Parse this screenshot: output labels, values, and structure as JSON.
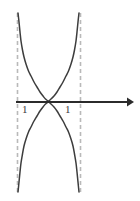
{
  "figure": {
    "title": "",
    "background_color": "#ffffff",
    "width": 140,
    "height": 201
  },
  "axis": {
    "x_axis_name": "x-axis",
    "arrow_name": "x-axis-arrow",
    "color": "#2b2b2b",
    "y_position": 102,
    "x_start": 16,
    "x_end": 134,
    "has_arrowhead": true
  },
  "asymptotes": {
    "style": "dashed",
    "color": "#b9b9b9",
    "lines": [
      {
        "name": "asymptote-left",
        "x_value": -1,
        "x_px": 17,
        "y_top": 13,
        "y_bottom": 192
      },
      {
        "name": "asymptote-right",
        "x_value": 1,
        "x_px": 80,
        "y_top": 13,
        "y_bottom": 192
      }
    ]
  },
  "labels": {
    "left": {
      "text": "1",
      "value": -1,
      "name": "tick-label-left"
    },
    "right": {
      "text": "1",
      "value": 1,
      "name": "tick-label-right"
    }
  },
  "chart_data": {
    "type": "line",
    "title": "",
    "xlabel": "",
    "ylabel": "",
    "xlim": [
      -1.6,
      3.0
    ],
    "ylim": [
      -2.3,
      2.3
    ],
    "grid": false,
    "legend": null,
    "annotations": [
      "vertical dashed asymptote at x = -1",
      "vertical dashed asymptote at x = 1",
      "both curve branches pass through the origin (0, 0)"
    ],
    "curve_color": "#3d3d3d",
    "series": [
      {
        "name": "upper-branch",
        "description": "U-shaped branch opening upward between the asymptotes, minimum at origin, rising to +infinity at x = -1 and x = 1",
        "points_px": [
          [
            18,
            13
          ],
          [
            19,
            22
          ],
          [
            20,
            32
          ],
          [
            21,
            41
          ],
          [
            22.5,
            50
          ],
          [
            24,
            57
          ],
          [
            26,
            64
          ],
          [
            28.5,
            71
          ],
          [
            31,
            76
          ],
          [
            34,
            82
          ],
          [
            37,
            87
          ],
          [
            40,
            92
          ],
          [
            43,
            96
          ],
          [
            45.5,
            99
          ],
          [
            48.5,
            101
          ],
          [
            51,
            99
          ],
          [
            54,
            96
          ],
          [
            57,
            92
          ],
          [
            60,
            87
          ],
          [
            63,
            82
          ],
          [
            66,
            76
          ],
          [
            68.5,
            71
          ],
          [
            71,
            64
          ],
          [
            73,
            57
          ],
          [
            74.5,
            50
          ],
          [
            76,
            41
          ],
          [
            77,
            32
          ],
          [
            78,
            22
          ],
          [
            79,
            13
          ]
        ]
      },
      {
        "name": "lower-branch",
        "description": "Inverted U-shaped branch opening downward between the asymptotes, maximum at origin, falling to -infinity at x = -1 and x = 1",
        "points_px": [
          [
            18,
            192
          ],
          [
            19,
            182
          ],
          [
            20,
            172
          ],
          [
            21,
            163
          ],
          [
            22.5,
            154
          ],
          [
            24,
            146
          ],
          [
            26,
            139
          ],
          [
            28.5,
            132
          ],
          [
            31,
            127
          ],
          [
            34,
            121
          ],
          [
            37,
            116
          ],
          [
            40,
            111
          ],
          [
            43,
            107
          ],
          [
            45.5,
            104
          ],
          [
            48.5,
            102
          ],
          [
            51,
            104
          ],
          [
            54,
            107
          ],
          [
            57,
            111
          ],
          [
            60,
            116
          ],
          [
            63,
            121
          ],
          [
            66,
            127
          ],
          [
            68.5,
            132
          ],
          [
            71,
            139
          ],
          [
            73,
            146
          ],
          [
            74.5,
            154
          ],
          [
            76,
            163
          ],
          [
            77,
            172
          ],
          [
            78,
            182
          ],
          [
            79,
            192
          ]
        ]
      }
    ]
  }
}
